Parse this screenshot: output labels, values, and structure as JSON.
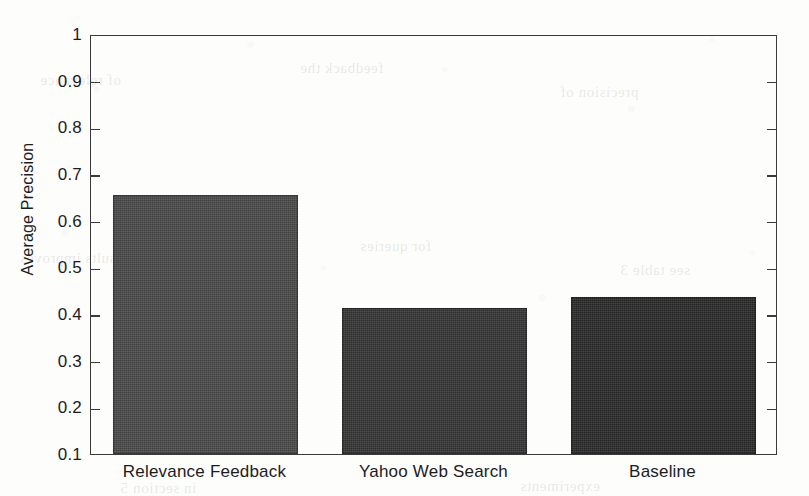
{
  "chart_data": {
    "type": "bar",
    "title": "",
    "subtitle": "",
    "xlabel": "",
    "ylabel": "Average Precision",
    "categories": [
      "Relevance Feedback",
      "Yahoo Web Search",
      "Baseline"
    ],
    "values": [
      0.656,
      0.412,
      0.437
    ],
    "series": [
      {
        "name": "Average Precision",
        "values": [
          0.656,
          0.412,
          0.437
        ]
      }
    ],
    "bar_colors": [
      "#4a4a4a",
      "#343434",
      "#2a2a2a"
    ],
    "ylim": [
      0.1,
      1
    ],
    "xlim": [
      0,
      3
    ],
    "ytick_labels": [
      "0.1",
      "0.2",
      "0.3",
      "0.4",
      "0.5",
      "0.6",
      "0.7",
      "0.8",
      "0.9",
      "1"
    ],
    "ytick_values": [
      0.1,
      0.2,
      0.3,
      0.4,
      0.5,
      0.6,
      0.7,
      0.8,
      0.9,
      1
    ],
    "xtick_labels": [
      "Relevance Feedback",
      "Yahoo Web Search",
      "Baseline"
    ],
    "grid": false,
    "legend": null,
    "legend_position": "none",
    "annotations": [],
    "axis_color": "#3b3b3b",
    "background_color": "#fdfdfc"
  },
  "figure": {
    "bleed_through_text": [
      "of relevance",
      "feedback the",
      "precision of",
      "results improves",
      "for queries",
      "see table 3",
      "in section 5",
      "experiments"
    ]
  }
}
